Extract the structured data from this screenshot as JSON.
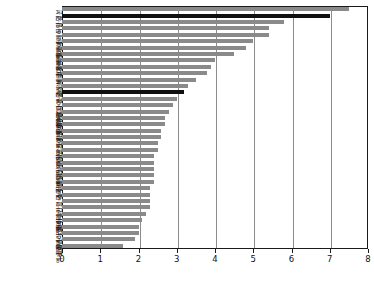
{
  "chart_data": {
    "type": "bar",
    "orientation": "horizontal",
    "title": "",
    "subtitle": "",
    "xlabel": "",
    "ylabel": "",
    "xlim": [
      0,
      8
    ],
    "ylim": null,
    "grid": true,
    "legend": null,
    "xticks": [
      "0",
      "1",
      "2",
      "3",
      "4",
      "5",
      "6",
      "7",
      "8"
    ],
    "xtick_values": [
      0,
      1,
      2,
      3,
      4,
      5,
      6,
      7,
      8
    ],
    "highlight_color": "#101010",
    "bar_color": "#8a8a8a",
    "categories": [
      "일본",
      "한국",
      "독일",
      "오스트리아",
      "리투아니아",
      "벨기에",
      "슬로바키아",
      "폴란드",
      "헝가리",
      "슬로베니아",
      "체코",
      "그리스",
      "스위스",
      "OECD 평균",
      "에스토니아",
      "룩셈부르크",
      "포르투갈",
      "라트비아",
      "노르웨이",
      "프랑스",
      "튀르키예",
      "아일랜드",
      "핀란드",
      "이탈리아",
      "네덜란드",
      "덴마크",
      "뉴질랜드",
      "스페인",
      "미국",
      "영국",
      "마이슬란드",
      "코스타리카",
      "캐나다",
      "칠레",
      "이스라엘",
      "콜롬비아",
      "스웨덴",
      "멕시코"
    ],
    "values": [
      7.5,
      7.0,
      5.8,
      5.4,
      5.4,
      5.0,
      4.8,
      4.5,
      4.0,
      3.9,
      3.8,
      3.5,
      3.3,
      3.2,
      3.0,
      2.9,
      2.8,
      2.7,
      2.7,
      2.6,
      2.6,
      2.5,
      2.5,
      2.4,
      2.4,
      2.4,
      2.4,
      2.4,
      2.3,
      2.3,
      2.3,
      2.3,
      2.2,
      2.1,
      2.0,
      2.0,
      1.9,
      1.6
    ],
    "highlighted_categories": [
      "한국",
      "OECD 평균"
    ]
  }
}
